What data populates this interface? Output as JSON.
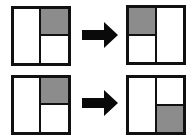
{
  "colors": {
    "border": "#111111",
    "shaded": "#8c8c8c",
    "empty": "#ffffff",
    "arrow": "#0a0a0a"
  },
  "rows": [
    {
      "before": {
        "layout": "left-column + right split",
        "shaded_cell": "top-right"
      },
      "arrow": "right-arrow",
      "after": {
        "layout": "left split + right column",
        "shaded_cell": "top-left"
      }
    },
    {
      "before": {
        "layout": "left-column + right split",
        "shaded_cell": "top-right"
      },
      "arrow": "right-arrow",
      "after": {
        "layout": "left-column + right split",
        "shaded_cell": "bottom-right"
      }
    }
  ]
}
